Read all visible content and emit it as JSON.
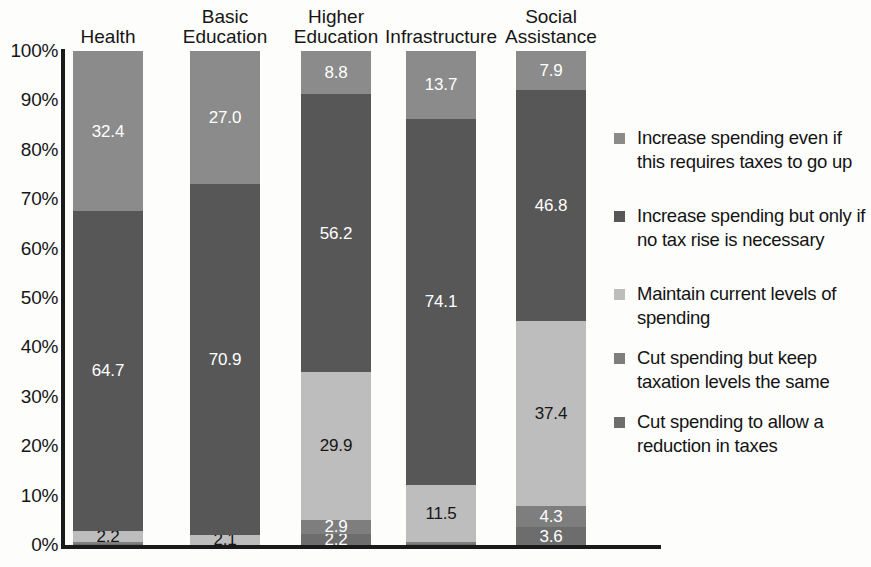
{
  "chart_data": {
    "type": "bar",
    "subtype": "stacked-bar-100",
    "title": "",
    "xlabel": "",
    "ylabel": "",
    "ylim": [
      0,
      100
    ],
    "grid": false,
    "legend_position": "right",
    "categories": [
      "Health",
      "Basic Education",
      "Higher Education",
      "Infrastructure",
      "Social Assistance"
    ],
    "category_labels": [
      "Health",
      "Basic\nEducation",
      "Higher\nEducation",
      "Infrastructure",
      "Social\nAssistance"
    ],
    "ytick_labels": [
      "100%",
      "90%",
      "80%",
      "70%",
      "60%",
      "50%",
      "40%",
      "30%",
      "20%",
      "10%",
      "0%"
    ],
    "ytick_values": [
      100,
      90,
      80,
      70,
      60,
      50,
      40,
      30,
      20,
      10,
      0
    ],
    "series": [
      {
        "name": "Increase spending even if this requires taxes to go up",
        "color": "#8b8b8b",
        "label_color": "#ffffff",
        "values": [
          32.4,
          27.0,
          8.8,
          13.7,
          7.9
        ],
        "labels": [
          "32.4",
          "27.0",
          "8.8",
          "13.7",
          "7.9"
        ]
      },
      {
        "name": "Increase spending but only if no tax rise is necessary",
        "color": "#575757",
        "label_color": "#ffffff",
        "values": [
          64.7,
          70.9,
          56.2,
          74.1,
          46.8
        ],
        "labels": [
          "64.7",
          "70.9",
          "56.2",
          "74.1",
          "46.8"
        ]
      },
      {
        "name": "Maintain current levels of spending",
        "color": "#bdbdbd",
        "label_color": "#161616",
        "values": [
          2.2,
          2.1,
          29.9,
          11.5,
          37.4
        ],
        "labels": [
          "2.2",
          "2.1",
          "29.9",
          "11.5",
          "37.4"
        ]
      },
      {
        "name": "Cut spending but keep taxation levels the same",
        "color": "#7e7e7e",
        "label_color": "#ffffff",
        "values": [
          0.4,
          0.0,
          2.9,
          0.4,
          4.3
        ],
        "labels": [
          "",
          "",
          "2.9",
          "",
          "4.3"
        ]
      },
      {
        "name": "Cut spending to allow a reduction in taxes",
        "color": "#6d6d6d",
        "label_color": "#ffffff",
        "values": [
          0.3,
          0.0,
          2.2,
          0.3,
          3.6
        ],
        "labels": [
          "",
          "",
          "2.2",
          "",
          "3.6"
        ]
      }
    ]
  },
  "legend": {
    "items": [
      {
        "label": "Increase spending even if this requires taxes to go up",
        "color": "#8b8b8b"
      },
      {
        "label": "Increase spending but only if no tax rise is necessary",
        "color": "#575757"
      },
      {
        "label": "Maintain current levels of spending",
        "color": "#bdbdbd"
      },
      {
        "label": "Cut spending but keep taxation levels the same",
        "color": "#7e7e7e"
      },
      {
        "label": "Cut spending to allow a reduction in taxes",
        "color": "#6d6d6d"
      }
    ]
  }
}
